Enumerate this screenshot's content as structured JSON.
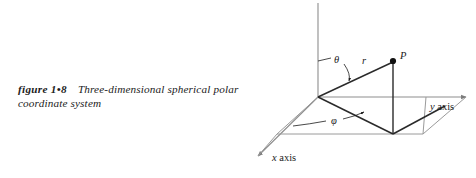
{
  "figure": {
    "caption": {
      "label": "figure 1•8",
      "text": "Three-dimensional spherical polar coordinate system"
    },
    "diagram": {
      "type": "spherical-polar-coordinate-system",
      "axes": [
        {
          "name": "x",
          "label": "x axis",
          "label_italic": "x",
          "label_rest": " axis"
        },
        {
          "name": "y",
          "label": "y axis",
          "label_italic": "y",
          "label_rest": " axis"
        },
        {
          "name": "z",
          "label": "",
          "label_italic": "",
          "label_rest": ""
        }
      ],
      "point_label": "P",
      "radius_label": "r",
      "polar_angle_label": "θ",
      "azimuthal_angle_label": "φ",
      "colors": {
        "ink": "#1b1b1b",
        "axis_line": "#8d8d8d",
        "solid_line": "#2a2a2a",
        "background": "#ffffff"
      }
    }
  }
}
